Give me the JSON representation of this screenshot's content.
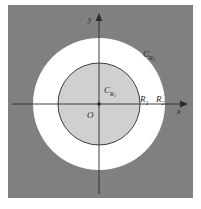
{
  "figure": {
    "name": "concentric-circles-annulus-diagram",
    "colors": {
      "page_background": "#ffffff",
      "plot_background": "#808080",
      "annulus_fill": "#ffffff",
      "inner_disk_fill": "#d0d0d0",
      "stroke": "#2b2b2b"
    },
    "plot_area": {
      "x": 8,
      "y": 5,
      "width": 185,
      "height": 193
    },
    "origin": {
      "x": 99,
      "y": 104
    }
  },
  "axes": {
    "x_label": "x",
    "y_label": "y",
    "origin_label": "O"
  },
  "circles": [
    {
      "name": "inner-circle",
      "label_c": "C",
      "label_sub": "R",
      "label_sub_index": "1",
      "radius_px": 41,
      "radius_label": "R",
      "radius_index": "1",
      "fill": "#d0d0d0",
      "stroked": true
    },
    {
      "name": "outer-circle",
      "label_c": "C",
      "label_sub": "R",
      "label_sub_index": "2",
      "radius_px": 66,
      "radius_label": "R",
      "radius_index": "2",
      "fill": "#ffffff",
      "stroked": false
    }
  ],
  "annotations": {
    "outer_circle_label_c": "C",
    "outer_circle_label_r": "R",
    "outer_circle_label_index": "2",
    "inner_circle_label_c": "C",
    "inner_circle_label_r": "R",
    "inner_circle_label_index": "1",
    "radius_inner_r": "R",
    "radius_inner_index": "1",
    "radius_outer_r": "R",
    "radius_outer_index": "2"
  }
}
